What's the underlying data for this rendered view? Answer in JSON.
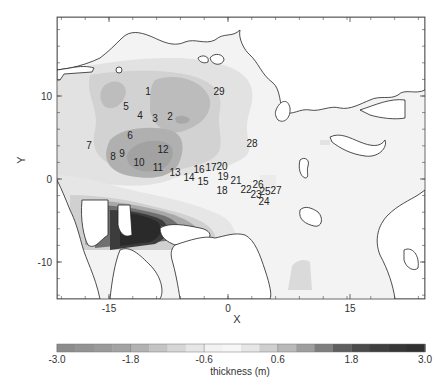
{
  "figure": {
    "type": "sea-ice-thickness-map",
    "plot_box": {
      "left": 57,
      "top": 17,
      "right": 425,
      "bottom": 299
    }
  },
  "axes": {
    "xlabel": "X",
    "ylabel": "Y",
    "x_ticks": [
      {
        "value": "-15",
        "px": 109
      },
      {
        "value": "0",
        "px": 228
      },
      {
        "value": "15",
        "px": 350
      }
    ],
    "y_ticks": [
      {
        "value": "10",
        "py": 96
      },
      {
        "value": "0",
        "py": 179
      },
      {
        "value": "-10",
        "py": 262
      }
    ]
  },
  "colorbar": {
    "label": "thickness (m)",
    "tick_labels": [
      "-3.0",
      "-1.8",
      "-0.6",
      "0.6",
      "1.8",
      "3.0"
    ],
    "bins": [
      "#8c8c8c",
      "#939393",
      "#9a9a9a",
      "#a3a3a3",
      "#b2b2b2",
      "#c4c4c4",
      "#d6d6d6",
      "#e6e6e6",
      "#f2f2f2",
      "#f6f6f6",
      "#e6e6e6",
      "#cfcfcf",
      "#b9b9b9",
      "#9e9e9e",
      "#7e7e7e",
      "#5e5e5e",
      "#4a4a4a",
      "#3e3e3e",
      "#363636",
      "#303030"
    ]
  },
  "stations": [
    {
      "id": "1",
      "x": 148,
      "y": 95
    },
    {
      "id": "2",
      "x": 170,
      "y": 120
    },
    {
      "id": "3",
      "x": 155,
      "y": 122
    },
    {
      "id": "4",
      "x": 140,
      "y": 119
    },
    {
      "id": "5",
      "x": 126,
      "y": 110
    },
    {
      "id": "6",
      "x": 130,
      "y": 139
    },
    {
      "id": "7",
      "x": 89,
      "y": 149
    },
    {
      "id": "8",
      "x": 113,
      "y": 160
    },
    {
      "id": "9",
      "x": 122,
      "y": 157
    },
    {
      "id": "10",
      "x": 139,
      "y": 166
    },
    {
      "id": "11",
      "x": 158,
      "y": 171
    },
    {
      "id": "12",
      "x": 163,
      "y": 153
    },
    {
      "id": "13",
      "x": 175,
      "y": 176
    },
    {
      "id": "14",
      "x": 189,
      "y": 181
    },
    {
      "id": "15",
      "x": 203,
      "y": 185
    },
    {
      "id": "16",
      "x": 199,
      "y": 173
    },
    {
      "id": "17",
      "x": 211,
      "y": 171
    },
    {
      "id": "20",
      "x": 222,
      "y": 170
    },
    {
      "id": "19",
      "x": 223,
      "y": 180
    },
    {
      "id": "21",
      "x": 236,
      "y": 184
    },
    {
      "id": "18",
      "x": 222,
      "y": 194
    },
    {
      "id": "22",
      "x": 246,
      "y": 193
    },
    {
      "id": "26",
      "x": 258,
      "y": 188
    },
    {
      "id": "23",
      "x": 256,
      "y": 198
    },
    {
      "id": "25",
      "x": 265,
      "y": 195
    },
    {
      "id": "27",
      "x": 276,
      "y": 194
    },
    {
      "id": "24",
      "x": 264,
      "y": 205
    },
    {
      "id": "28",
      "x": 252,
      "y": 147
    },
    {
      "id": "29",
      "x": 219,
      "y": 95
    }
  ]
}
